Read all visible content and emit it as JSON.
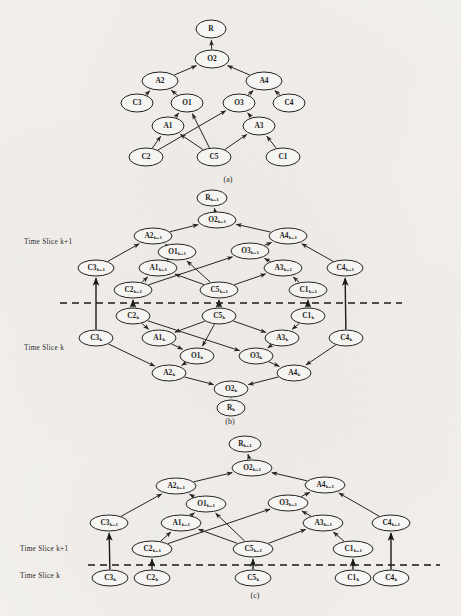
{
  "figure": {
    "background_color": "#f5f3f0",
    "ink_color": "#1a1a1a"
  },
  "panels": [
    {
      "id": "a",
      "caption": "(a)",
      "caption_x": 228,
      "caption_y": 182,
      "divider": null,
      "slice_labels": [],
      "nodes": [
        {
          "id": "R",
          "base": "R",
          "sub": "",
          "x": 211,
          "y": 29,
          "rx": 15,
          "ry": 9
        },
        {
          "id": "O2",
          "base": "O2",
          "sub": "",
          "x": 212,
          "y": 59,
          "rx": 17,
          "ry": 9
        },
        {
          "id": "A2",
          "base": "A2",
          "sub": "",
          "x": 160,
          "y": 81,
          "rx": 18,
          "ry": 9
        },
        {
          "id": "A4",
          "base": "A4",
          "sub": "",
          "x": 264,
          "y": 81,
          "rx": 18,
          "ry": 9
        },
        {
          "id": "C3",
          "base": "C3",
          "sub": "",
          "x": 137,
          "y": 103,
          "rx": 16,
          "ry": 9
        },
        {
          "id": "O1",
          "base": "O1",
          "sub": "",
          "x": 187,
          "y": 103,
          "rx": 16,
          "ry": 9
        },
        {
          "id": "O3",
          "base": "O3",
          "sub": "",
          "x": 239,
          "y": 103,
          "rx": 16,
          "ry": 9
        },
        {
          "id": "C4",
          "base": "C4",
          "sub": "",
          "x": 289,
          "y": 103,
          "rx": 16,
          "ry": 9
        },
        {
          "id": "A1",
          "base": "A1",
          "sub": "",
          "x": 168,
          "y": 126,
          "rx": 16,
          "ry": 9
        },
        {
          "id": "A3",
          "base": "A3",
          "sub": "",
          "x": 259,
          "y": 126,
          "rx": 16,
          "ry": 9
        },
        {
          "id": "C2",
          "base": "C2",
          "sub": "",
          "x": 146,
          "y": 157,
          "rx": 17,
          "ry": 9
        },
        {
          "id": "C5",
          "base": "C5",
          "sub": "",
          "x": 214,
          "y": 157,
          "rx": 17,
          "ry": 9
        },
        {
          "id": "C1",
          "base": "C1",
          "sub": "",
          "x": 283,
          "y": 157,
          "rx": 17,
          "ry": 9
        }
      ],
      "edges": [
        {
          "from": "O2",
          "to": "R",
          "arrow": true
        },
        {
          "from": "A2",
          "to": "O2",
          "arrow": true
        },
        {
          "from": "A4",
          "to": "O2",
          "arrow": true
        },
        {
          "from": "C3",
          "to": "A2",
          "arrow": true
        },
        {
          "from": "O1",
          "to": "A2",
          "arrow": true
        },
        {
          "from": "O3",
          "to": "A4",
          "arrow": true
        },
        {
          "from": "C4",
          "to": "A4",
          "arrow": true
        },
        {
          "from": "A1",
          "to": "O1",
          "arrow": true
        },
        {
          "from": "C5",
          "to": "O1",
          "arrow": true
        },
        {
          "from": "A3",
          "to": "O3",
          "arrow": true
        },
        {
          "from": "C2",
          "to": "O3",
          "arrow": true
        },
        {
          "from": "C2",
          "to": "A1",
          "arrow": true
        },
        {
          "from": "C5",
          "to": "A1",
          "arrow": true
        },
        {
          "from": "C5",
          "to": "A3",
          "arrow": true
        },
        {
          "from": "C1",
          "to": "A3",
          "arrow": true
        }
      ],
      "slice_edges": []
    },
    {
      "id": "b",
      "caption": "(b)",
      "caption_x": 230,
      "caption_y": 424,
      "divider": {
        "x1": 60,
        "x2": 402,
        "y": 303
      },
      "slice_labels": [
        {
          "text": "Time Slice k+1",
          "x": 24,
          "y": 244
        },
        {
          "text": "Time Slice k",
          "x": 24,
          "y": 350
        }
      ],
      "nodes": [
        {
          "id": "Rk1",
          "base": "R",
          "sub": "k+1",
          "x": 212,
          "y": 198,
          "rx": 15,
          "ry": 8
        },
        {
          "id": "O2k1",
          "base": "O2",
          "sub": "k+1",
          "x": 217,
          "y": 220,
          "rx": 19,
          "ry": 8
        },
        {
          "id": "A2k1",
          "base": "A2",
          "sub": "k+1",
          "x": 153,
          "y": 236,
          "rx": 19,
          "ry": 8
        },
        {
          "id": "A4k1",
          "base": "A4",
          "sub": "k+1",
          "x": 288,
          "y": 236,
          "rx": 19,
          "ry": 8
        },
        {
          "id": "O1k1",
          "base": "O1",
          "sub": "k+1",
          "x": 177,
          "y": 252,
          "rx": 19,
          "ry": 8
        },
        {
          "id": "O3k1",
          "base": "O3",
          "sub": "k+1",
          "x": 250,
          "y": 251,
          "rx": 19,
          "ry": 8
        },
        {
          "id": "C3k1",
          "base": "C3",
          "sub": "k+1",
          "x": 96,
          "y": 268,
          "rx": 18,
          "ry": 8
        },
        {
          "id": "A1k1",
          "base": "A1",
          "sub": "k+1",
          "x": 158,
          "y": 268,
          "rx": 19,
          "ry": 8
        },
        {
          "id": "A3k1",
          "base": "A3",
          "sub": "k+1",
          "x": 283,
          "y": 268,
          "rx": 19,
          "ry": 8
        },
        {
          "id": "C4k1",
          "base": "C4",
          "sub": "k+1",
          "x": 345,
          "y": 268,
          "rx": 18,
          "ry": 8
        },
        {
          "id": "C2k1",
          "base": "C2",
          "sub": "k+1",
          "x": 133,
          "y": 290,
          "rx": 19,
          "ry": 8
        },
        {
          "id": "C5k1",
          "base": "C5",
          "sub": "k+1",
          "x": 219,
          "y": 290,
          "rx": 19,
          "ry": 8
        },
        {
          "id": "C1k1",
          "base": "C1",
          "sub": "k+1",
          "x": 308,
          "y": 290,
          "rx": 19,
          "ry": 8
        },
        {
          "id": "C2k",
          "base": "C2",
          "sub": "k",
          "x": 133,
          "y": 316,
          "rx": 17,
          "ry": 8
        },
        {
          "id": "C5k",
          "base": "C5",
          "sub": "k",
          "x": 219,
          "y": 316,
          "rx": 17,
          "ry": 8
        },
        {
          "id": "C1k",
          "base": "C1",
          "sub": "k",
          "x": 308,
          "y": 316,
          "rx": 17,
          "ry": 8
        },
        {
          "id": "C3k",
          "base": "C3",
          "sub": "k",
          "x": 96,
          "y": 338,
          "rx": 17,
          "ry": 8
        },
        {
          "id": "A1k",
          "base": "A1",
          "sub": "k",
          "x": 159,
          "y": 338,
          "rx": 17,
          "ry": 8
        },
        {
          "id": "A3k",
          "base": "A3",
          "sub": "k",
          "x": 282,
          "y": 338,
          "rx": 17,
          "ry": 8
        },
        {
          "id": "C4k",
          "base": "C4",
          "sub": "k",
          "x": 346,
          "y": 338,
          "rx": 17,
          "ry": 8
        },
        {
          "id": "O1k",
          "base": "O1",
          "sub": "k",
          "x": 197,
          "y": 356,
          "rx": 17,
          "ry": 8
        },
        {
          "id": "O3k",
          "base": "O3",
          "sub": "k",
          "x": 256,
          "y": 356,
          "rx": 17,
          "ry": 8
        },
        {
          "id": "A2k",
          "base": "A2",
          "sub": "k",
          "x": 169,
          "y": 373,
          "rx": 17,
          "ry": 8
        },
        {
          "id": "A4k",
          "base": "A4",
          "sub": "k",
          "x": 294,
          "y": 373,
          "rx": 17,
          "ry": 8
        },
        {
          "id": "O2k",
          "base": "O2",
          "sub": "k",
          "x": 231,
          "y": 389,
          "rx": 17,
          "ry": 8
        },
        {
          "id": "Rk",
          "base": "R",
          "sub": "k",
          "x": 231,
          "y": 408,
          "rx": 14,
          "ry": 8
        }
      ],
      "edges": [
        {
          "from": "O2k1",
          "to": "Rk1",
          "arrow": true
        },
        {
          "from": "A2k1",
          "to": "O2k1",
          "arrow": true
        },
        {
          "from": "A4k1",
          "to": "O2k1",
          "arrow": true
        },
        {
          "from": "C3k1",
          "to": "A2k1",
          "arrow": true
        },
        {
          "from": "O1k1",
          "to": "A2k1",
          "arrow": true
        },
        {
          "from": "O3k1",
          "to": "A4k1",
          "arrow": true
        },
        {
          "from": "C4k1",
          "to": "A4k1",
          "arrow": true
        },
        {
          "from": "A1k1",
          "to": "O1k1",
          "arrow": true
        },
        {
          "from": "C5k1",
          "to": "O1k1",
          "arrow": true
        },
        {
          "from": "A3k1",
          "to": "O3k1",
          "arrow": true
        },
        {
          "from": "C2k1",
          "to": "O3k1",
          "arrow": true
        },
        {
          "from": "C2k1",
          "to": "A1k1",
          "arrow": true
        },
        {
          "from": "C5k1",
          "to": "A1k1",
          "arrow": true
        },
        {
          "from": "C5k1",
          "to": "A3k1",
          "arrow": true
        },
        {
          "from": "C1k1",
          "to": "A3k1",
          "arrow": true
        },
        {
          "from": "C3k",
          "to": "A2k",
          "arrow": true
        },
        {
          "from": "O1k",
          "to": "A2k",
          "arrow": true
        },
        {
          "from": "O3k",
          "to": "A4k",
          "arrow": true
        },
        {
          "from": "C4k",
          "to": "A4k",
          "arrow": true
        },
        {
          "from": "A1k",
          "to": "O1k",
          "arrow": true
        },
        {
          "from": "C5k",
          "to": "O1k",
          "arrow": true
        },
        {
          "from": "A3k",
          "to": "O3k",
          "arrow": true
        },
        {
          "from": "C2k",
          "to": "O3k",
          "arrow": true
        },
        {
          "from": "C2k",
          "to": "A1k",
          "arrow": true
        },
        {
          "from": "C5k",
          "to": "A1k",
          "arrow": true
        },
        {
          "from": "C5k",
          "to": "A3k",
          "arrow": true
        },
        {
          "from": "C1k",
          "to": "A3k",
          "arrow": true
        },
        {
          "from": "A2k",
          "to": "O2k",
          "arrow": true
        },
        {
          "from": "A4k",
          "to": "O2k",
          "arrow": true
        },
        {
          "from": "O2k",
          "to": "Rk",
          "arrow": true
        }
      ],
      "slice_edges": [
        {
          "from": "C3k",
          "to": "C3k1",
          "arrow": true
        },
        {
          "from": "C2k",
          "to": "C2k1",
          "arrow": true
        },
        {
          "from": "C5k",
          "to": "C5k1",
          "arrow": true
        },
        {
          "from": "C1k",
          "to": "C1k1",
          "arrow": true
        },
        {
          "from": "C4k",
          "to": "C4k1",
          "arrow": true
        }
      ]
    },
    {
      "id": "c",
      "caption": "(c)",
      "caption_x": 255,
      "caption_y": 598,
      "divider": {
        "x1": 88,
        "x2": 440,
        "y": 565
      },
      "slice_labels": [
        {
          "text": "Time Slice k+1",
          "x": 20,
          "y": 551
        },
        {
          "text": "Time Slice k",
          "x": 20,
          "y": 578
        }
      ],
      "nodes": [
        {
          "id": "Rk1",
          "base": "R",
          "sub": "k+1",
          "x": 245,
          "y": 444,
          "rx": 16,
          "ry": 8
        },
        {
          "id": "O2k1",
          "base": "O2",
          "sub": "k+1",
          "x": 252,
          "y": 468,
          "rx": 20,
          "ry": 8
        },
        {
          "id": "A2k1",
          "base": "A2",
          "sub": "k+1",
          "x": 176,
          "y": 486,
          "rx": 20,
          "ry": 8
        },
        {
          "id": "A4k1",
          "base": "A4",
          "sub": "k+1",
          "x": 325,
          "y": 485,
          "rx": 20,
          "ry": 8
        },
        {
          "id": "O1k1",
          "base": "O1",
          "sub": "k+1",
          "x": 206,
          "y": 504,
          "rx": 20,
          "ry": 8
        },
        {
          "id": "O3k1",
          "base": "O3",
          "sub": "k+1",
          "x": 288,
          "y": 503,
          "rx": 20,
          "ry": 8
        },
        {
          "id": "C3k1",
          "base": "C3",
          "sub": "k+1",
          "x": 109,
          "y": 523,
          "rx": 19,
          "ry": 8
        },
        {
          "id": "A1k1",
          "base": "A1",
          "sub": "k+1",
          "x": 181,
          "y": 523,
          "rx": 20,
          "ry": 8
        },
        {
          "id": "A3k1",
          "base": "A3",
          "sub": "k+1",
          "x": 323,
          "y": 523,
          "rx": 20,
          "ry": 8
        },
        {
          "id": "C4k1",
          "base": "C4",
          "sub": "k+1",
          "x": 391,
          "y": 523,
          "rx": 19,
          "ry": 8
        },
        {
          "id": "C2k1",
          "base": "C2",
          "sub": "k+1",
          "x": 152,
          "y": 549,
          "rx": 20,
          "ry": 8
        },
        {
          "id": "C5k1",
          "base": "C5",
          "sub": "k+1",
          "x": 253,
          "y": 549,
          "rx": 20,
          "ry": 8
        },
        {
          "id": "C1k1",
          "base": "C1",
          "sub": "k+1",
          "x": 353,
          "y": 549,
          "rx": 20,
          "ry": 8
        },
        {
          "id": "C3k",
          "base": "C3",
          "sub": "k",
          "x": 110,
          "y": 578,
          "rx": 18,
          "ry": 8
        },
        {
          "id": "C2k",
          "base": "C2",
          "sub": "k",
          "x": 152,
          "y": 578,
          "rx": 18,
          "ry": 8
        },
        {
          "id": "C5k",
          "base": "C5",
          "sub": "k",
          "x": 253,
          "y": 578,
          "rx": 18,
          "ry": 8
        },
        {
          "id": "C1k",
          "base": "C1",
          "sub": "k",
          "x": 353,
          "y": 578,
          "rx": 18,
          "ry": 8
        },
        {
          "id": "C4k",
          "base": "C4",
          "sub": "k",
          "x": 391,
          "y": 578,
          "rx": 18,
          "ry": 8
        }
      ],
      "edges": [
        {
          "from": "O2k1",
          "to": "Rk1",
          "arrow": true
        },
        {
          "from": "A2k1",
          "to": "O2k1",
          "arrow": true
        },
        {
          "from": "A4k1",
          "to": "O2k1",
          "arrow": true
        },
        {
          "from": "C3k1",
          "to": "A2k1",
          "arrow": true
        },
        {
          "from": "O1k1",
          "to": "A2k1",
          "arrow": true
        },
        {
          "from": "O3k1",
          "to": "A4k1",
          "arrow": true
        },
        {
          "from": "C4k1",
          "to": "A4k1",
          "arrow": true
        },
        {
          "from": "A1k1",
          "to": "O1k1",
          "arrow": true
        },
        {
          "from": "C5k1",
          "to": "O1k1",
          "arrow": true
        },
        {
          "from": "A3k1",
          "to": "O3k1",
          "arrow": true
        },
        {
          "from": "C2k1",
          "to": "O3k1",
          "arrow": true
        },
        {
          "from": "C2k1",
          "to": "A1k1",
          "arrow": true
        },
        {
          "from": "C5k1",
          "to": "A1k1",
          "arrow": true
        },
        {
          "from": "C5k1",
          "to": "A3k1",
          "arrow": true
        },
        {
          "from": "C1k1",
          "to": "A3k1",
          "arrow": true
        }
      ],
      "slice_edges": [
        {
          "from": "C3k",
          "to": "C3k1",
          "arrow": true
        },
        {
          "from": "C2k",
          "to": "C2k1",
          "arrow": true
        },
        {
          "from": "C5k",
          "to": "C5k1",
          "arrow": true
        },
        {
          "from": "C1k",
          "to": "C1k1",
          "arrow": true
        },
        {
          "from": "C4k",
          "to": "C4k1",
          "arrow": true
        }
      ]
    }
  ]
}
